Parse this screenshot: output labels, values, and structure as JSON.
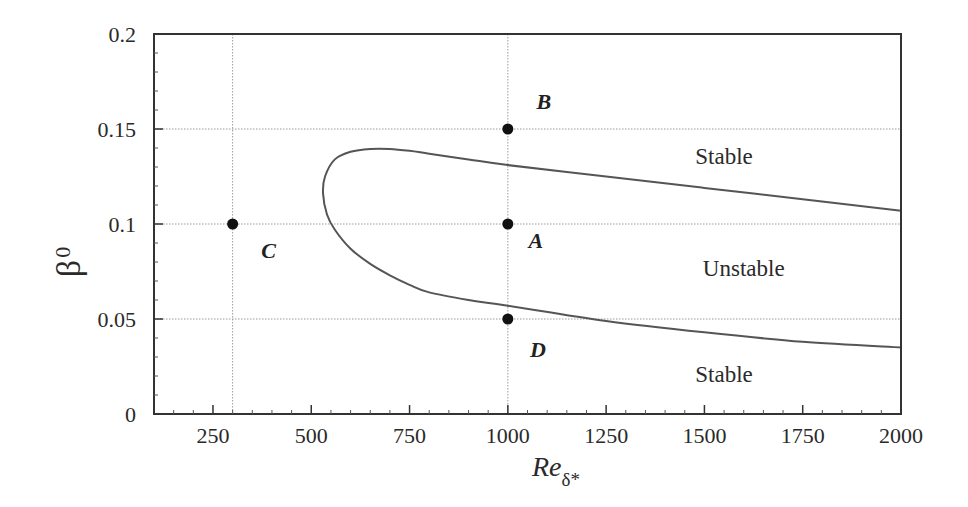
{
  "chart_data": {
    "type": "line",
    "title": "",
    "xlabel": "Re_δ*",
    "xlabel_main": "Re",
    "xlabel_sub": "δ*",
    "ylabel": "β_0",
    "ylabel_main": "β",
    "ylabel_sub": "0",
    "xlim": [
      100,
      2000
    ],
    "ylim": [
      0,
      0.2
    ],
    "x_ticks": [
      250,
      500,
      750,
      1000,
      1250,
      1500,
      1750,
      2000
    ],
    "x_tick_labels": [
      "250",
      "500",
      "750",
      "1000",
      "1250",
      "1500",
      "1750",
      "2000"
    ],
    "y_ticks": [
      0,
      0.05,
      0.1,
      0.15,
      0.2
    ],
    "y_tick_labels": [
      "0",
      "0.05",
      "0.1",
      "0.15",
      "0.2"
    ],
    "grid": {
      "x": [
        300,
        1000
      ],
      "y": [
        0.05,
        0.1,
        0.15
      ],
      "style": "dotted"
    },
    "legend": null,
    "series": [
      {
        "name": "Neutral stability curve",
        "color": "#555555",
        "x": [
          2000,
          1750,
          1500,
          1250,
          1000,
          900,
          800,
          750,
          700,
          650,
          600,
          560,
          535,
          530,
          540,
          560,
          600,
          650,
          700,
          750,
          800,
          900,
          1000,
          1250,
          1500,
          1750,
          2000
        ],
        "y": [
          0.107,
          0.113,
          0.119,
          0.125,
          0.131,
          0.134,
          0.137,
          0.1385,
          0.1395,
          0.1395,
          0.138,
          0.134,
          0.125,
          0.116,
          0.105,
          0.097,
          0.087,
          0.079,
          0.073,
          0.068,
          0.064,
          0.06,
          0.057,
          0.049,
          0.043,
          0.038,
          0.035
        ]
      }
    ],
    "points": [
      {
        "label": "A",
        "x": 1000,
        "y": 0.1
      },
      {
        "label": "B",
        "x": 1000,
        "y": 0.15
      },
      {
        "label": "C",
        "x": 300,
        "y": 0.1
      },
      {
        "label": "D",
        "x": 1000,
        "y": 0.05
      }
    ],
    "annotations": [
      {
        "text": "Stable",
        "x": 1550,
        "y": 0.136
      },
      {
        "text": "Unstable",
        "x": 1600,
        "y": 0.077
      },
      {
        "text": "Stable",
        "x": 1550,
        "y": 0.021
      }
    ]
  }
}
